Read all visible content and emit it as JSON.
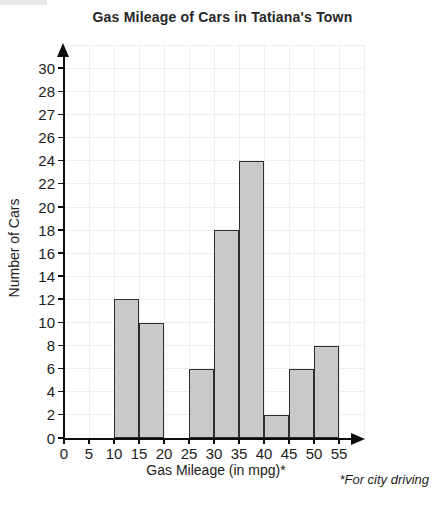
{
  "chart_data": {
    "type": "bar",
    "title": "Gas Mileage of Cars in Tatiana's Town",
    "xlabel": "Gas Mileage (in mpg)*",
    "ylabel": "Number of Cars",
    "annotation": "*For city driving",
    "x_tick_labels": [
      "0",
      "5",
      "10",
      "15",
      "20",
      "25",
      "30",
      "35",
      "40",
      "45",
      "50",
      "55"
    ],
    "y_tick_labels_bottom_to_top": [
      "0",
      "2",
      "4",
      "6",
      "8",
      "10",
      "12",
      "14",
      "16",
      "18",
      "20",
      "22",
      "24",
      "26",
      "27",
      "28",
      "30"
    ],
    "y_axis_layout_note": "tick labels evenly spaced even though increments are unequal (misleading-scale graph)",
    "grid": true,
    "legend": "none",
    "bins": [
      {
        "range": [
          10,
          15
        ],
        "count": 12
      },
      {
        "range": [
          15,
          20
        ],
        "count": 10
      },
      {
        "range": [
          20,
          25
        ],
        "count": 0
      },
      {
        "range": [
          25,
          30
        ],
        "count": 6
      },
      {
        "range": [
          30,
          35
        ],
        "count": 18
      },
      {
        "range": [
          35,
          40
        ],
        "count": 24
      },
      {
        "range": [
          40,
          45
        ],
        "count": 2
      },
      {
        "range": [
          45,
          50
        ],
        "count": 6
      },
      {
        "range": [
          50,
          55
        ],
        "count": 8
      }
    ],
    "colors": {
      "bar_fill": "#c9c9c9",
      "bar_border": "#2e2e2e",
      "gridline": "#efedec",
      "axis": "#0d0d0d",
      "text": "#1c1c1c"
    }
  }
}
